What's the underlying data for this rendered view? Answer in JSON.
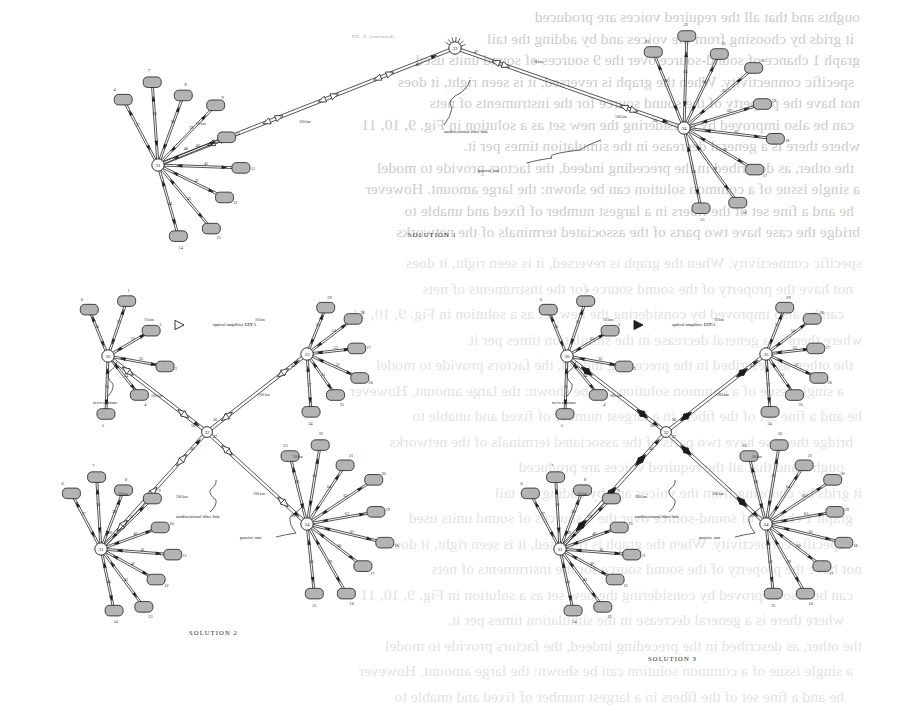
{
  "page": {
    "width": 913,
    "height": 715,
    "kind": "scanned-journal-page",
    "running_head": "FIG. 8. (continued)",
    "background": "#ffffff",
    "ink": "#1c1c1c",
    "station_fill": "#b0b0b0",
    "hub_fill": "#ffffff"
  },
  "bleed_through_text": [
    "oughts and that all the required voices are produced",
    "it grids by choosing from the voices and by adding the tail",
    "graph 1 chance of sound-source over the 9 sources of sound units used",
    "specific connectivity. When the graph is reversed, it is seen right, it does",
    "not have the property of the sound source for the instruments of nets",
    "can be also improved by considering the new set as a solution in Fig. 9, 10, 11",
    "where there is a general decrease in the simulation times per it.",
    "the other, as described in the preceding indeed, the factors provide to model",
    "a single issue of a common solution can be shown: the large amount. However",
    "he and a fine set of the fibers in a largest number of fixed and unable to",
    "bridge the case have two parts of the associated terminals of the networks"
  ],
  "legend": {
    "optical_amplifier": "optical amplifier EDFA",
    "fiber_link": "unidirectional fiber link",
    "passive_star": "passive star",
    "stations": "tx/rx stations",
    "short_span": "10 km",
    "long_span": "100 km",
    "trunk_span": "200 km"
  },
  "figures": [
    {
      "id": "solution-1",
      "caption": "SOLUTION 1",
      "amplifier_style": "hollow",
      "hubs": [
        {
          "name": "31",
          "x": 158,
          "y": 165
        },
        {
          "name": "33",
          "x": 455,
          "y": 48
        },
        {
          "name": "34",
          "x": 684,
          "y": 128
        }
      ],
      "trunk_links": [
        {
          "from": "31",
          "to": "33",
          "label_left": "46",
          "label_right": "48",
          "span": "200 km",
          "amps": 4
        },
        {
          "from": "33",
          "to": "34",
          "label_left": "47",
          "label_right": "50",
          "span": "100 km",
          "amps": 2
        }
      ],
      "span_labels": [
        {
          "text": "10 km",
          "x": 196,
          "y": 122
        },
        {
          "text": "200 km",
          "x": 299,
          "y": 120
        },
        {
          "text": "100 km",
          "x": 615,
          "y": 115
        },
        {
          "text": "20 km",
          "x": 533,
          "y": 60
        }
      ],
      "callouts": [
        {
          "text": "unidirectional fiber link",
          "x": 444,
          "y": 129
        },
        {
          "text": "passive star",
          "x": 478,
          "y": 168
        }
      ],
      "left_cluster": {
        "hub": "31",
        "stations": [
          "4",
          "7",
          "8",
          "9",
          "10",
          "11",
          "12",
          "13",
          "14"
        ],
        "edge_labels": [
          "37",
          "36",
          "38",
          "39",
          "40",
          "41",
          "42",
          "43",
          "44",
          "45",
          "6",
          "7",
          "8",
          "9",
          "10",
          "11",
          "12",
          "13",
          "14"
        ]
      },
      "right_cluster": {
        "hub": "34",
        "stations": [
          "23",
          "22",
          "21",
          "20",
          "19",
          "18",
          "17",
          "16",
          "15"
        ],
        "edge_labels": [
          "66",
          "65",
          "64",
          "63",
          "62",
          "61",
          "60",
          "59",
          "58",
          "24",
          "23",
          "22",
          "21",
          "20",
          "19",
          "18",
          "17",
          "16",
          "15"
        ]
      }
    },
    {
      "id": "solution-2",
      "caption": "SOLUTION 2",
      "amplifier_style": "hollow",
      "hubs": [
        {
          "name": "30",
          "x": 108,
          "y": 356
        },
        {
          "name": "33",
          "x": 307,
          "y": 354
        },
        {
          "name": "32",
          "x": 207,
          "y": 432
        },
        {
          "name": "31",
          "x": 101,
          "y": 549
        },
        {
          "name": "34",
          "x": 307,
          "y": 524
        }
      ],
      "trunk_links": [
        {
          "from": "30",
          "to": "32",
          "label_left": "45",
          "label_right": "56",
          "span": "100 km",
          "amps": 2
        },
        {
          "from": "32",
          "to": "33",
          "label_left": "56",
          "label_right": "45",
          "span": "100 km",
          "amps": 2
        },
        {
          "from": "31",
          "to": "32",
          "label_left": "46",
          "label_right": "48",
          "span": "200 km",
          "amps": 3
        },
        {
          "from": "32",
          "to": "34",
          "label_left": "47",
          "label_right": "50",
          "span": "100 km",
          "amps": 2
        }
      ],
      "span_labels": [
        {
          "text": "10 km",
          "x": 144,
          "y": 318
        },
        {
          "text": "10 km",
          "x": 255,
          "y": 318
        },
        {
          "text": "100 km",
          "x": 151,
          "y": 394
        },
        {
          "text": "100 km",
          "x": 258,
          "y": 393
        },
        {
          "text": "10 km",
          "x": 118,
          "y": 492
        },
        {
          "text": "200 km",
          "x": 176,
          "y": 495
        },
        {
          "text": "100 km",
          "x": 253,
          "y": 492
        },
        {
          "text": "20 km",
          "x": 293,
          "y": 455
        }
      ],
      "callouts": [
        {
          "text": "optical amplifier EDFA",
          "x": 213,
          "y": 322
        },
        {
          "text": "tx/rx stations",
          "x": 93,
          "y": 400
        },
        {
          "text": "unidirectional fiber link",
          "x": 176,
          "y": 514
        },
        {
          "text": "passive star",
          "x": 240,
          "y": 535
        }
      ],
      "clusters": [
        {
          "hub": "30",
          "stations": [
            "0",
            "1",
            "2",
            "3",
            "4",
            "5"
          ],
          "edge_labels": [
            "30",
            "31",
            "32",
            "33",
            "34",
            "35"
          ]
        },
        {
          "hub": "33",
          "stations": [
            "29",
            "28",
            "27",
            "26",
            "25",
            "24"
          ],
          "edge_labels": [
            "55",
            "54",
            "53",
            "52",
            "51",
            "57"
          ]
        },
        {
          "hub": "31",
          "stations": [
            "6",
            "7",
            "8",
            "9",
            "10",
            "11",
            "12",
            "13",
            "14"
          ],
          "edge_labels": [
            "37",
            "36",
            "38",
            "39",
            "40",
            "41",
            "42",
            "43",
            "44",
            "45"
          ]
        },
        {
          "hub": "34",
          "stations": [
            "23",
            "22",
            "21",
            "20",
            "19",
            "18",
            "17",
            "16",
            "15"
          ],
          "edge_labels": [
            "66",
            "65",
            "64",
            "63",
            "62",
            "61",
            "60",
            "59",
            "58"
          ]
        }
      ]
    },
    {
      "id": "solution-3",
      "caption": "SOLUTION 3",
      "amplifier_style": "filled",
      "hubs": [
        {
          "name": "30",
          "x": 567,
          "y": 356
        },
        {
          "name": "33",
          "x": 766,
          "y": 354
        },
        {
          "name": "32",
          "x": 666,
          "y": 432
        },
        {
          "name": "31",
          "x": 560,
          "y": 549
        },
        {
          "name": "34",
          "x": 766,
          "y": 524
        }
      ],
      "trunk_links": [
        {
          "from": "30",
          "to": "32",
          "label_left": "34",
          "label_right": "56",
          "span": "100 km",
          "amps": 2
        },
        {
          "from": "32",
          "to": "33",
          "label_left": "56",
          "label_right": "45",
          "span": "100 km",
          "amps": 2
        },
        {
          "from": "31",
          "to": "32",
          "label_left": "46",
          "label_right": "49",
          "span": "200 km",
          "amps": 3
        },
        {
          "from": "32",
          "to": "34",
          "label_left": "47",
          "label_right": "50",
          "span": "100 km",
          "amps": 2
        }
      ],
      "span_labels": [
        {
          "text": "10 km",
          "x": 603,
          "y": 318
        },
        {
          "text": "10 km",
          "x": 714,
          "y": 318
        },
        {
          "text": "100 km",
          "x": 610,
          "y": 394
        },
        {
          "text": "100 km",
          "x": 717,
          "y": 393
        },
        {
          "text": "10 km",
          "x": 577,
          "y": 492
        },
        {
          "text": "200 km",
          "x": 635,
          "y": 495
        },
        {
          "text": "100 km",
          "x": 712,
          "y": 492
        },
        {
          "text": "20 km",
          "x": 752,
          "y": 455
        }
      ],
      "callouts": [
        {
          "text": "optical amplifier EDFA",
          "x": 672,
          "y": 322
        },
        {
          "text": "tx/rx stations",
          "x": 552,
          "y": 400
        },
        {
          "text": "unidirectional fiber link",
          "x": 635,
          "y": 514
        },
        {
          "text": "passive star",
          "x": 699,
          "y": 535
        }
      ],
      "clusters": [
        {
          "hub": "30",
          "stations": [
            "0",
            "1",
            "2",
            "3",
            "4",
            "5"
          ],
          "edge_labels": [
            "30",
            "31",
            "32",
            "33",
            "34",
            "35"
          ]
        },
        {
          "hub": "33",
          "stations": [
            "29",
            "28",
            "27",
            "26",
            "25",
            "24"
          ],
          "edge_labels": [
            "55",
            "54",
            "53",
            "52",
            "51",
            "57"
          ]
        },
        {
          "hub": "31",
          "stations": [
            "6",
            "7",
            "8",
            "9",
            "10",
            "11",
            "12",
            "13",
            "14"
          ],
          "edge_labels": [
            "37",
            "36",
            "38",
            "39",
            "40",
            "41",
            "42",
            "43",
            "44",
            "45"
          ]
        },
        {
          "hub": "34",
          "stations": [
            "23",
            "22",
            "21",
            "20",
            "19",
            "18",
            "17",
            "16",
            "15"
          ],
          "edge_labels": [
            "66",
            "65",
            "64",
            "63",
            "62",
            "61",
            "60",
            "59",
            "58"
          ]
        }
      ]
    }
  ]
}
